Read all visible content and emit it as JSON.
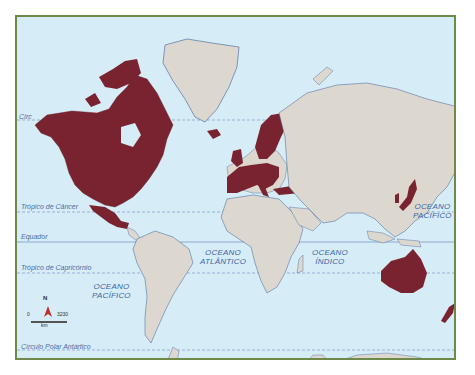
{
  "map": {
    "colors": {
      "ocean": "#d6ecf6",
      "land": "#ddd8cf",
      "highlighted": "#7a2330",
      "border": "#6f8a48",
      "coastline": "#3d5f9c",
      "label": "#4a6fa8"
    },
    "reference_lines": [
      {
        "name": "Círculo Polar Ártico",
        "label": "Círc",
        "style": "dashed"
      },
      {
        "name": "Trópico de Câncer",
        "label": "Trópico de Câncer",
        "style": "dashed"
      },
      {
        "name": "Equador",
        "label": "Equador",
        "style": "solid"
      },
      {
        "name": "Trópico de Capricórnio",
        "label": "Trópico de Capricórnio",
        "style": "dashed"
      },
      {
        "name": "Círculo Polar Antártico",
        "label": "Círculo Polar Antártico",
        "style": "dashed"
      }
    ],
    "oceans": [
      {
        "line1": "OCEANO",
        "line2": "PACÍFICO",
        "position": "northeast"
      },
      {
        "line1": "OCEANO",
        "line2": "ATLÂNTICO",
        "position": "south-atlantic"
      },
      {
        "line1": "OCEANO",
        "line2": "ÍNDICO",
        "position": "indian"
      },
      {
        "line1": "OCEANO",
        "line2": "PACÍFICO",
        "position": "southwest"
      }
    ],
    "highlighted_regions": [
      "Canadá",
      "Estados Unidos",
      "México",
      "Islândia",
      "Noruega",
      "Suécia",
      "Finlândia",
      "Reino Unido",
      "Irlanda",
      "França",
      "Espanha",
      "Portugal",
      "Alemanha",
      "Itália",
      "Polônia",
      "Grécia",
      "Turquia",
      "Japão",
      "Coreia do Sul",
      "Austrália",
      "Nova Zelândia"
    ],
    "compass": {
      "label": "N"
    },
    "scale": {
      "min": "0",
      "max": "3230",
      "unit": "km"
    }
  }
}
